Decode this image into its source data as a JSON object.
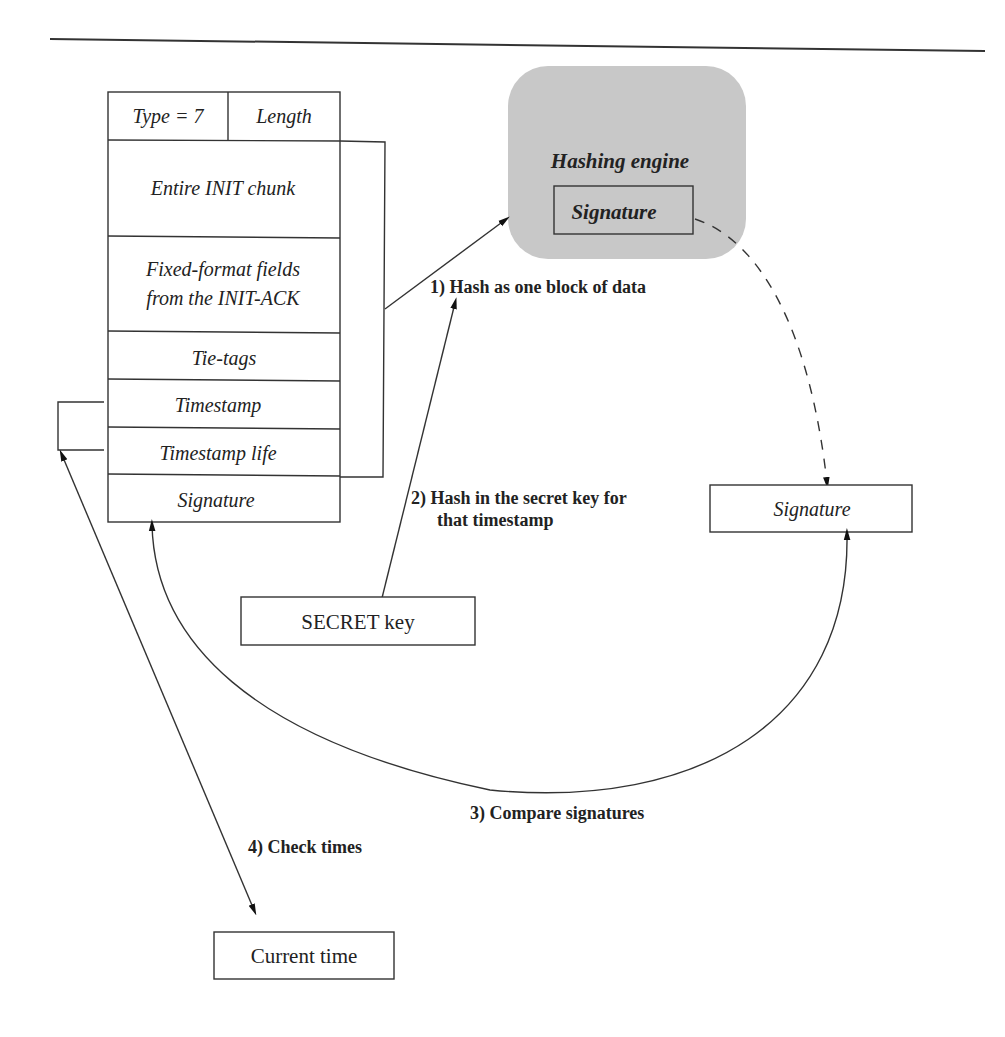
{
  "diagram": {
    "cookie_fields": [
      {
        "label": "Type = 7"
      },
      {
        "label": "Length"
      },
      {
        "label": "Entire INIT chunk"
      },
      {
        "label_line1": "Fixed-format fields",
        "label_line2": "from the INIT-ACK"
      },
      {
        "label": "Tie-tags"
      },
      {
        "label": "Timestamp"
      },
      {
        "label": "Timestamp life"
      },
      {
        "label": "Signature"
      }
    ],
    "hashing_engine": {
      "title": "Hashing engine",
      "inner_label": "Signature",
      "fill_color": "#c8c8c8"
    },
    "secret_key_box": {
      "label": "SECRET key"
    },
    "computed_signature_box": {
      "label": "Signature"
    },
    "current_time_box": {
      "label": "Current time"
    },
    "steps": [
      {
        "label": "1) Hash as one block of data"
      },
      {
        "label_line1": "2) Hash in the secret key for",
        "label_line2": "that timestamp"
      },
      {
        "label": "3) Compare signatures"
      },
      {
        "label": "4) Check times"
      }
    ]
  }
}
